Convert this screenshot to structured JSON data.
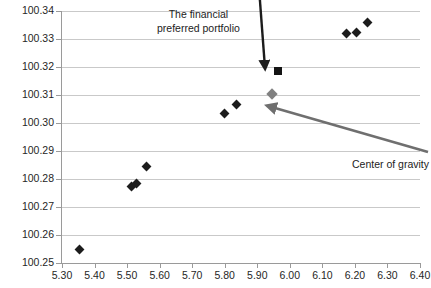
{
  "chart_data": {
    "type": "scatter",
    "title": "",
    "xlabel": "",
    "ylabel": "",
    "xlim": [
      5.3,
      6.4
    ],
    "ylim": [
      100.25,
      100.34
    ],
    "grid": true,
    "legend": "none",
    "xticks": [
      "5.30",
      "5.40",
      "5.50",
      "5.60",
      "5.70",
      "5.80",
      "5.90",
      "6.00",
      "6.10",
      "6.20",
      "6.30",
      "6.40"
    ],
    "xtick_values": [
      5.3,
      5.4,
      5.5,
      5.6,
      5.7,
      5.8,
      5.9,
      6.0,
      6.1,
      6.2,
      6.3,
      6.4
    ],
    "yticks": [
      "100.25",
      "100.26",
      "100.27",
      "100.28",
      "100.29",
      "100.30",
      "100.31",
      "100.32",
      "100.33",
      "100.34"
    ],
    "ytick_values": [
      100.25,
      100.26,
      100.27,
      100.28,
      100.29,
      100.3,
      100.31,
      100.32,
      100.33,
      100.34
    ],
    "series": [
      {
        "name": "portfolios",
        "marker": "diamond",
        "color": "#1c1c1c",
        "points": [
          {
            "x": 5.355,
            "y": 100.255
          },
          {
            "x": 5.515,
            "y": 100.2775
          },
          {
            "x": 5.53,
            "y": 100.2785
          },
          {
            "x": 5.56,
            "y": 100.2845
          },
          {
            "x": 5.8,
            "y": 100.3035
          },
          {
            "x": 5.835,
            "y": 100.3065
          },
          {
            "x": 6.175,
            "y": 100.332
          },
          {
            "x": 6.205,
            "y": 100.3325
          },
          {
            "x": 6.24,
            "y": 100.336
          }
        ]
      },
      {
        "name": "center of gravity",
        "marker": "diamond",
        "color": "#808080",
        "points": [
          {
            "x": 5.945,
            "y": 100.3105
          }
        ]
      },
      {
        "name": "the financial preferred portfolio",
        "marker": "square",
        "color": "#141414",
        "points": [
          {
            "x": 5.965,
            "y": 100.3185
          }
        ]
      }
    ],
    "annotations": [
      {
        "id": "financial",
        "text_lines": [
          "The financial",
          "preferred portfolio"
        ],
        "arrow_color": "#1c1c1c",
        "points_to": {
          "x": 5.965,
          "y": 100.3185
        }
      },
      {
        "id": "cog",
        "text_lines": [
          "Center of gravity"
        ],
        "arrow_color": "#6f6f6f",
        "points_to": {
          "x": 5.945,
          "y": 100.3105
        }
      }
    ]
  },
  "annotations_text": {
    "financial_line1": "The financial",
    "financial_line2": "preferred portfolio",
    "center_of_gravity": "Center of gravity"
  }
}
